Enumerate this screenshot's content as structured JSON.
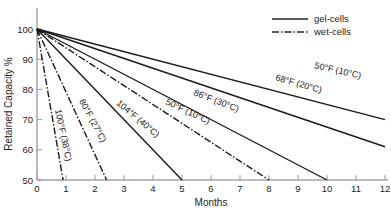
{
  "chart_data": {
    "type": "line",
    "title": "",
    "xlabel": "Months",
    "ylabel": "Retained Capacity %",
    "xlim": [
      0,
      12
    ],
    "ylim": [
      50,
      100
    ],
    "x_ticks": [
      0,
      1,
      2,
      3,
      4,
      5,
      6,
      7,
      8,
      9,
      10,
      11,
      12
    ],
    "y_ticks": [
      50,
      60,
      70,
      80,
      90,
      100
    ],
    "grid": false,
    "legend_position": "top-right",
    "legend": [
      {
        "label": "gel-cells",
        "style": "solid"
      },
      {
        "label": "wet-cells",
        "style": "dash-dot"
      }
    ],
    "series": [
      {
        "name": "50°F (10°C)",
        "cell": "gel-cells",
        "style": "solid",
        "points": [
          [
            0,
            100
          ],
          [
            12,
            70
          ]
        ]
      },
      {
        "name": "68°F (20°C)",
        "cell": "gel-cells",
        "style": "solid",
        "points": [
          [
            0,
            100
          ],
          [
            12,
            61
          ]
        ]
      },
      {
        "name": "86°F (30°C)",
        "cell": "gel-cells",
        "style": "solid",
        "points": [
          [
            0,
            100
          ],
          [
            10,
            50
          ]
        ]
      },
      {
        "name": "50°F (10°C)",
        "cell": "wet-cells",
        "style": "dash-dot",
        "points": [
          [
            0,
            100
          ],
          [
            8,
            50
          ]
        ]
      },
      {
        "name": "104°F (40°C)",
        "cell": "gel-cells",
        "style": "solid",
        "points": [
          [
            0,
            100
          ],
          [
            5,
            50
          ]
        ]
      },
      {
        "name": "80°F (27°C)",
        "cell": "wet-cells",
        "style": "dash-dot",
        "points": [
          [
            0,
            100
          ],
          [
            2.4,
            50
          ]
        ]
      },
      {
        "name": "100°F (38°C)",
        "cell": "wet-cells",
        "style": "dash-dot",
        "points": [
          [
            0,
            100
          ],
          [
            0.9,
            50
          ]
        ]
      }
    ]
  },
  "labels": {
    "xlabel": "Months",
    "ylabel": "Retained Capacity %",
    "legend_gel": "gel-cells",
    "legend_wet": "wet-cells",
    "l_gel50": "50°F (10°C)",
    "l_gel68": "68°F (20°C)",
    "l_gel86": "86°F (30°C)",
    "l_wet50": "50°F (10°C)",
    "l_gel104": "104°F (40°C)",
    "l_wet80": "80°F (27°C)",
    "l_wet100": "100°F (38°C)"
  }
}
